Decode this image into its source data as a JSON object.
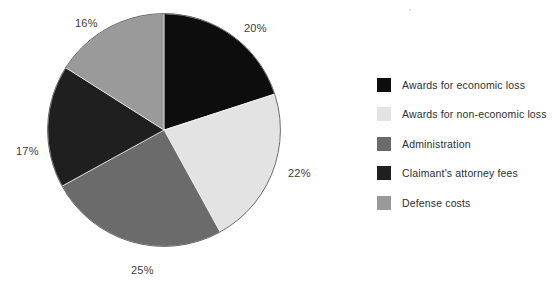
{
  "chart_data": {
    "type": "pie",
    "title": "",
    "subtitle": "",
    "xlabel": "",
    "ylabel": "",
    "grid": false,
    "legend_position": "right",
    "start_angle_deg": 0,
    "direction": "clockwise",
    "categories": [
      "Awards for economic loss",
      "Awards for non-economic loss",
      "Administration",
      "Claimant's attorney fees",
      "Defense costs"
    ],
    "values": [
      20,
      22,
      25,
      17,
      16
    ],
    "value_unit": "%",
    "data_labels": [
      "20%",
      "22%",
      "25%",
      "17%",
      "16%"
    ],
    "colors": [
      "#0d0d0d",
      "#e3e3e3",
      "#6b6b6b",
      "#1f1f1f",
      "#9a9a9a"
    ],
    "slices": [
      {
        "label": "Awards for economic loss",
        "value": 20,
        "data_label": "20%",
        "color": "#0d0d0d"
      },
      {
        "label": "Awards for non-economic loss",
        "value": 22,
        "data_label": "22%",
        "color": "#e3e3e3"
      },
      {
        "label": "Administration",
        "value": 25,
        "data_label": "25%",
        "color": "#6b6b6b"
      },
      {
        "label": "Claimant's attorney fees",
        "value": 17,
        "data_label": "17%",
        "color": "#1f1f1f"
      },
      {
        "label": "Defense costs",
        "value": 16,
        "data_label": "16%",
        "color": "#9a9a9a"
      }
    ]
  },
  "legend": {
    "items": [
      {
        "label": "Awards for economic loss",
        "color": "#0d0d0d"
      },
      {
        "label": "Awards for non-economic loss",
        "color": "#e3e3e3"
      },
      {
        "label": "Administration",
        "color": "#6b6b6b"
      },
      {
        "label": "Claimant's attorney fees",
        "color": "#1f1f1f"
      },
      {
        "label": "Defense costs",
        "color": "#9a9a9a"
      }
    ]
  },
  "labels": {
    "pct_20": "20%",
    "pct_22": "22%",
    "pct_25": "25%",
    "pct_17": "17%",
    "pct_16": "16%"
  }
}
